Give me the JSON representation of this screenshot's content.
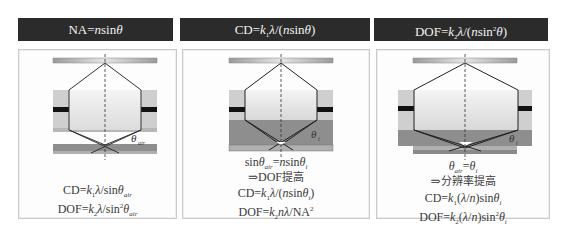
{
  "headers": [
    {
      "label": "NA=nsinθ"
    },
    {
      "label": "CD=k₁λ/(nsinθ)"
    },
    {
      "label": "DOF=k₂λ/(nsin²θ)"
    }
  ],
  "panels": [
    {
      "medium": "air",
      "angle_label": "θ_air",
      "lines": [
        "CD=k₁λ/sinθ_air",
        "DOF=k₂λ/sin²θ_air"
      ]
    },
    {
      "medium": "immersion (same lens)",
      "angle_label": "θ_i",
      "lines": [
        "sinθ_air=nsinθ_i",
        "⇒DOF提高",
        "CD=k₁λ/(nsinθ_i)",
        "DOF=k₂nλ/NA²"
      ]
    },
    {
      "medium": "immersion (larger lens)",
      "angle_label": "θ_i",
      "lines": [
        "θ_air=θ_i",
        "⇒分辨率提高",
        "CD=k₁(λ/n)sinθ_i",
        "DOF=k₂(λ/n)sin²θ_i"
      ]
    }
  ],
  "colors": {
    "header_bg": "#2b2b2b",
    "header_text": "#f2f2f2",
    "lens_fill": "#e8e8e8",
    "lens_side": "#c8c8c8",
    "black_band": "#111111",
    "fluid": "#8e8e8e",
    "wafer": "#9a9a9a"
  }
}
